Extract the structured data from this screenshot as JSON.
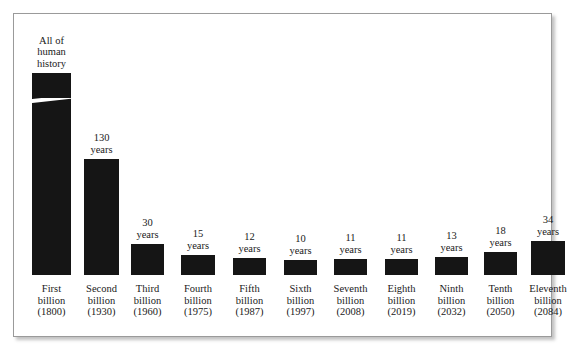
{
  "chart_data": {
    "type": "bar",
    "title": "",
    "subtitle": "",
    "xlabel": "",
    "ylabel": "",
    "grid": false,
    "legend": null,
    "axis_break": true,
    "axis_break_note": "First bar truncated by diagonal break; its span is all of human history rather than a countable number of years",
    "value_unit": "years",
    "categories": [
      "First billion (1800)",
      "Second billion (1930)",
      "Third billion (1960)",
      "Fourth billion (1975)",
      "Fifth billion (1987)",
      "Sixth billion (1997)",
      "Seventh billion (2008)",
      "Eighth billion (2019)",
      "Ninth billion (2032)",
      "Tenth billion (2050)",
      "Eleventh billion (2084)"
    ],
    "values": [
      null,
      130,
      30,
      15,
      12,
      10,
      11,
      11,
      13,
      18,
      34
    ],
    "bars": [
      {
        "rank": "First",
        "name_line1": "First",
        "name_line2": "billion",
        "name_line3": "(1800)",
        "year": "1800",
        "value": null,
        "value_line1": "All of",
        "value_line2": "human",
        "value_line3": "history",
        "broken": true,
        "left": 31,
        "width": 39,
        "top": 74,
        "label_top": 29,
        "break_top": 99
      },
      {
        "rank": "Second",
        "name_line1": "Second",
        "name_line2": "billion",
        "name_line3": "(1930)",
        "year": "1930",
        "value": 130,
        "value_line1": "130",
        "value_line2": "years",
        "broken": false,
        "left": 83,
        "width": 35,
        "top": 160,
        "label_top": 131
      },
      {
        "rank": "Third",
        "name_line1": "Third",
        "name_line2": "billion",
        "name_line3": "(1960)",
        "year": "1960",
        "value": 30,
        "value_line1": "30",
        "value_line2": "years",
        "broken": false,
        "left": 130,
        "width": 33,
        "top": 245,
        "label_top": 216
      },
      {
        "rank": "Fourth",
        "name_line1": "Fourth",
        "name_line2": "billion",
        "name_line3": "(1975)",
        "year": "1975",
        "value": 15,
        "value_line1": "15",
        "value_line2": "years",
        "broken": false,
        "left": 180,
        "width": 34,
        "top": 256,
        "label_top": 227
      },
      {
        "rank": "Fifth",
        "name_line1": "Fifth",
        "name_line2": "billion",
        "name_line3": "(1987)",
        "year": "1987",
        "value": 12,
        "value_line1": "12",
        "value_line2": "years",
        "broken": false,
        "left": 232,
        "width": 33,
        "top": 259,
        "label_top": 230
      },
      {
        "rank": "Sixth",
        "name_line1": "Sixth",
        "name_line2": "billion",
        "name_line3": "(1997)",
        "year": "1997",
        "value": 10,
        "value_line1": "10",
        "value_line2": "years",
        "broken": false,
        "left": 283,
        "width": 33,
        "top": 261,
        "label_top": 232
      },
      {
        "rank": "Seventh",
        "name_line1": "Seventh",
        "name_line2": "billion",
        "name_line3": "(2008)",
        "year": "2008",
        "value": 11,
        "value_line1": "11",
        "value_line2": "years",
        "broken": false,
        "left": 333,
        "width": 33,
        "top": 260,
        "label_top": 231
      },
      {
        "rank": "Eighth",
        "name_line1": "Eighth",
        "name_line2": "billion",
        "name_line3": "(2019)",
        "year": "2019",
        "value": 11,
        "value_line1": "11",
        "value_line2": "years",
        "broken": false,
        "left": 384,
        "width": 33,
        "top": 260,
        "label_top": 231
      },
      {
        "rank": "Ninth",
        "name_line1": "Ninth",
        "name_line2": "billion",
        "name_line3": "(2032)",
        "year": "2032",
        "value": 13,
        "value_line1": "13",
        "value_line2": "years",
        "broken": false,
        "left": 434,
        "width": 33,
        "top": 258,
        "label_top": 229
      },
      {
        "rank": "Tenth",
        "name_line1": "Tenth",
        "name_line2": "billion",
        "name_line3": "(2050)",
        "year": "2050",
        "value": 18,
        "value_line1": "18",
        "value_line2": "years",
        "broken": false,
        "left": 483,
        "width": 33,
        "top": 253,
        "label_top": 224
      },
      {
        "rank": "Eleventh",
        "name_line1": "Eleventh",
        "name_line2": "billion",
        "name_line3": "(2084)",
        "year": "2084",
        "value": 34,
        "value_line1": "34",
        "value_line2": "years",
        "broken": false,
        "left": 530,
        "width": 34,
        "top": 242,
        "label_top": 213
      }
    ],
    "colors": {
      "bar": "#151515",
      "background": "#ffffff",
      "frame": "#9a9a9a",
      "text": "#1a1a1a"
    }
  }
}
